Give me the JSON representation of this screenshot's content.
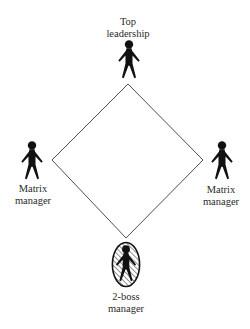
{
  "diagram": {
    "type": "matrix-organization-diamond",
    "shape": "diamond",
    "colors": {
      "line": "#3a3a3a",
      "figure": "#111111",
      "text": "#2a2a2a",
      "background": "#ffffff"
    },
    "vertices": {
      "top": [
        128,
        84
      ],
      "left": [
        52,
        160
      ],
      "right": [
        203,
        160
      ],
      "bottom": [
        126,
        238
      ]
    },
    "nodes": [
      {
        "id": "top",
        "role": "Top leadership",
        "label_lines": [
          "Top",
          "leadership"
        ],
        "icon": "person-icon",
        "highlighted": false
      },
      {
        "id": "left",
        "role": "Matrix manager",
        "label_lines": [
          "Matrix",
          "manager"
        ],
        "icon": "person-icon",
        "highlighted": false
      },
      {
        "id": "right",
        "role": "Matrix manager",
        "label_lines": [
          "Matrix",
          "manager"
        ],
        "icon": "person-icon",
        "highlighted": false
      },
      {
        "id": "bottom",
        "role": "2-boss manager",
        "label_lines": [
          "2-boss",
          "manager"
        ],
        "icon": "person-icon",
        "highlighted": true,
        "highlight_style": "hatched-oval"
      }
    ],
    "edges": [
      [
        "top",
        "left"
      ],
      [
        "top",
        "right"
      ],
      [
        "left",
        "bottom"
      ],
      [
        "right",
        "bottom"
      ]
    ]
  }
}
